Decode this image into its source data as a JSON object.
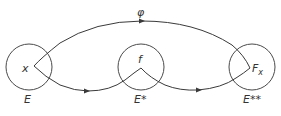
{
  "diagram": {
    "type": "mapping-diagram",
    "stroke_color": "#3a3a3a",
    "nodes": [
      {
        "id": "E",
        "label": "E",
        "element": "x",
        "cx": 29,
        "cy": 67,
        "r": 23
      },
      {
        "id": "E*",
        "label": "E*",
        "element": "f",
        "cx": 141,
        "cy": 67,
        "r": 23
      },
      {
        "id": "E**",
        "label": "E**",
        "element": "F",
        "element_sub": "x",
        "cx": 252,
        "cy": 67,
        "r": 23
      }
    ],
    "edges": [
      {
        "from": "E",
        "to": "E**",
        "label": "φ",
        "direction": "forward",
        "path": "top-arc"
      },
      {
        "from": "E",
        "to": "E*",
        "label": "",
        "direction": "forward",
        "path": "lower-arc"
      },
      {
        "from": "E*",
        "to": "E**",
        "label": "",
        "direction": "forward",
        "path": "lower-arc"
      }
    ]
  },
  "labels": {
    "phi": "φ",
    "x": "x",
    "f": "f",
    "Fx_main": "F",
    "Fx_sub": "x",
    "E": "E",
    "E_star": "E*",
    "E_star_star": "E**"
  }
}
